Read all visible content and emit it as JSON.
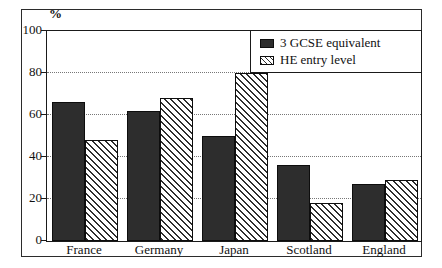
{
  "chart_data": {
    "type": "bar",
    "title": "",
    "categories": [
      "France",
      "Germany",
      "Japan",
      "Scotland",
      "England"
    ],
    "series": [
      {
        "name": "3 GCSE equivalent",
        "pattern": "solid",
        "values": [
          66,
          62,
          50,
          36,
          27
        ]
      },
      {
        "name": "HE entry level",
        "pattern": "hatch",
        "values": [
          48,
          68,
          80,
          18,
          29
        ]
      }
    ],
    "xlabel": "",
    "ylabel": "%",
    "ylim": [
      0,
      100
    ],
    "yticks": [
      0,
      20,
      40,
      60,
      80,
      100
    ],
    "grid": "horizontal-dotted",
    "legend_position": "top-right"
  },
  "colors": {
    "solid_bar": "#2d2d2d",
    "hatch_line": "#2e2e2e",
    "axis": "#1a1a1a",
    "background": "#ffffff"
  }
}
